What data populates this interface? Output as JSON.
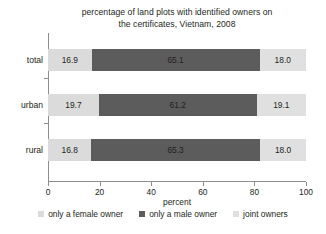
{
  "chart_data": {
    "type": "bar",
    "orientation": "horizontal",
    "stacked": true,
    "title": "percentage of land plots with identified owners on the certificates, Vietnam, 2008",
    "title_lines": [
      "percentage of land plots with identified owners on",
      "the certificates, Vietnam, 2008"
    ],
    "xlabel": "percent",
    "ylabel": "",
    "xlim": [
      0,
      100
    ],
    "xticks": [
      0,
      20,
      40,
      60,
      80,
      100
    ],
    "xtick_labels": [
      "0",
      "20",
      "40",
      "60",
      "80",
      "100"
    ],
    "grid": false,
    "legend_position": "bottom",
    "categories": [
      "total",
      "urban",
      "rural"
    ],
    "series": [
      {
        "name": "only a female owner",
        "color": "#dbdbdb",
        "values": [
          16.9,
          19.7,
          16.8
        ],
        "labels": [
          "16.9",
          "19.7",
          "16.8"
        ]
      },
      {
        "name": "only a male owner",
        "color": "#5c5c5c",
        "values": [
          65.1,
          61.2,
          65.3
        ],
        "labels": [
          "65.1",
          "61.2",
          "65.3"
        ]
      },
      {
        "name": "joint owners",
        "color": "#e0e0e0",
        "values": [
          18.0,
          19.1,
          18.0
        ],
        "labels": [
          "18.0",
          "19.1",
          "18.0"
        ]
      }
    ],
    "rows": [
      {
        "category": "total",
        "segments": [
          {
            "series": "only a female owner",
            "value": 16.9,
            "label": "16.9"
          },
          {
            "series": "only a male owner",
            "value": 65.1,
            "label": "65.1"
          },
          {
            "series": "joint owners",
            "value": 18.0,
            "label": "18.0"
          }
        ]
      },
      {
        "category": "urban",
        "segments": [
          {
            "series": "only a female owner",
            "value": 19.7,
            "label": "19.7"
          },
          {
            "series": "only a male owner",
            "value": 61.2,
            "label": "61.2"
          },
          {
            "series": "joint owners",
            "value": 19.1,
            "label": "19.1"
          }
        ]
      },
      {
        "category": "rural",
        "segments": [
          {
            "series": "only a female owner",
            "value": 16.8,
            "label": "16.8"
          },
          {
            "series": "only a male owner",
            "value": 65.3,
            "label": "65.3"
          },
          {
            "series": "joint owners",
            "value": 18.0,
            "label": "18.0"
          }
        ]
      }
    ],
    "legend": [
      {
        "label": "only a female owner",
        "color": "#dbdbdb"
      },
      {
        "label": "only a male owner",
        "color": "#5c5c5c"
      },
      {
        "label": "joint owners",
        "color": "#e0e0e0"
      }
    ],
    "colors": {
      "axis": "#8c8c8c",
      "text": "#231f20",
      "background": "#ffffff"
    }
  }
}
